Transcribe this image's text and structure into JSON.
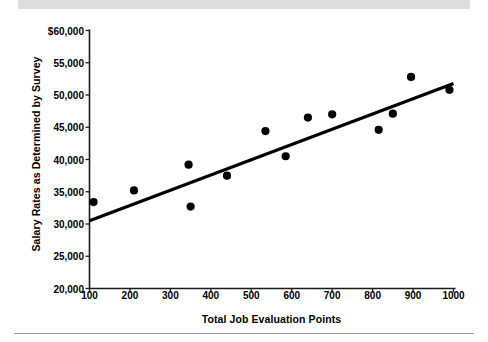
{
  "figure": {
    "top_band_color": "#dedede",
    "bottom_rule_color": "#9a9a9a",
    "background_color": "#ffffff"
  },
  "chart_data": {
    "type": "scatter",
    "title": "",
    "xlabel": "Total Job Evaluation Points",
    "ylabel": "Salary Rates as Determined by Survey",
    "xlim": [
      100,
      1000
    ],
    "ylim": [
      20000,
      60000
    ],
    "grid": false,
    "legend": null,
    "marker_color": "#000000",
    "trendline_color": "#000000",
    "x_ticks": [
      100,
      200,
      300,
      400,
      500,
      600,
      700,
      800,
      900,
      1000
    ],
    "x_tick_labels": [
      "100",
      "200",
      "300",
      "400",
      "500",
      "600",
      "700",
      "800",
      "900",
      "1000"
    ],
    "y_ticks": [
      20000,
      25000,
      30000,
      35000,
      40000,
      45000,
      50000,
      55000,
      60000
    ],
    "y_tick_labels": [
      "20,000",
      "25,000",
      "30,000",
      "35,000",
      "40,000",
      "45,000",
      "50,000",
      "55,000",
      "$60,000"
    ],
    "points": [
      {
        "x": 110,
        "y": 33400
      },
      {
        "x": 210,
        "y": 35200
      },
      {
        "x": 345,
        "y": 39200
      },
      {
        "x": 350,
        "y": 32700
      },
      {
        "x": 440,
        "y": 37500
      },
      {
        "x": 535,
        "y": 44400
      },
      {
        "x": 585,
        "y": 40500
      },
      {
        "x": 640,
        "y": 46500
      },
      {
        "x": 700,
        "y": 47000
      },
      {
        "x": 815,
        "y": 44600
      },
      {
        "x": 850,
        "y": 47100
      },
      {
        "x": 895,
        "y": 52800
      },
      {
        "x": 990,
        "y": 50800
      }
    ],
    "trendline": {
      "x_start": 100,
      "y_start": 30500,
      "x_end": 1000,
      "y_end": 51800
    }
  }
}
